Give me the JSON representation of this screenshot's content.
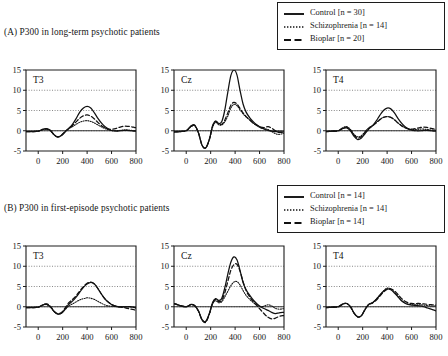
{
  "figure": {
    "sections": [
      {
        "id": "A",
        "title": "(A) P300 in long-term psychotic patients"
      },
      {
        "id": "B",
        "title": "(B) P300 in first-episode psychotic patients"
      }
    ]
  },
  "legends": {
    "A": {
      "entries": [
        {
          "label": "Control [n = 30]",
          "style": "solid",
          "name": "control"
        },
        {
          "label": "Schizophrenia [n = 14]",
          "style": "dotted",
          "name": "schizophrenia"
        },
        {
          "label": "Bioplar [n = 20]",
          "style": "dashed",
          "name": "bipolar"
        }
      ]
    },
    "B": {
      "entries": [
        {
          "label": "Control [n = 14]",
          "style": "solid",
          "name": "control"
        },
        {
          "label": "Schizophrenia [n = 14]",
          "style": "dotted",
          "name": "schizophrenia"
        },
        {
          "label": "Bioplar [n = 14]",
          "style": "dashed",
          "name": "bipolar"
        }
      ]
    }
  },
  "chart_data": [
    {
      "id": "A-T3",
      "type": "line",
      "section": "A",
      "title": "T3",
      "xlabel": "",
      "ylabel": "",
      "xlim": [
        -100,
        800
      ],
      "ylim": [
        -5,
        15
      ],
      "xticks": [
        0,
        200,
        400,
        600,
        800
      ],
      "yticks": [
        -5,
        0,
        5,
        10,
        15
      ],
      "grid": "horizontal-dotted",
      "x": [
        -100,
        -50,
        0,
        40,
        70,
        100,
        130,
        160,
        190,
        220,
        250,
        280,
        310,
        340,
        370,
        400,
        430,
        460,
        490,
        520,
        550,
        580,
        610,
        640,
        670,
        700,
        730,
        760,
        790,
        800
      ],
      "series": [
        {
          "name": "Control",
          "style": "solid",
          "values": [
            -0.2,
            -0.2,
            -0.1,
            0.4,
            0.5,
            0.1,
            -1.0,
            -1.6,
            -1.2,
            -0.3,
            0.6,
            1.6,
            3.0,
            4.6,
            5.6,
            6.0,
            5.6,
            4.4,
            3.0,
            1.8,
            0.9,
            0.3,
            0.0,
            -0.1,
            0.0,
            0.1,
            0.1,
            0.0,
            -0.1,
            -0.1
          ]
        },
        {
          "name": "Schizophrenia",
          "style": "dotted",
          "values": [
            -0.2,
            -0.2,
            -0.1,
            0.3,
            0.4,
            0.0,
            -1.0,
            -1.5,
            -1.1,
            -0.2,
            0.5,
            1.0,
            1.6,
            2.1,
            2.4,
            2.5,
            2.3,
            1.9,
            1.4,
            0.9,
            0.5,
            0.2,
            0.0,
            0.0,
            0.1,
            0.2,
            0.2,
            0.1,
            0.0,
            0.0
          ]
        },
        {
          "name": "Bioplar",
          "style": "dashed",
          "values": [
            -0.2,
            -0.2,
            -0.1,
            0.3,
            0.4,
            0.0,
            -1.0,
            -1.5,
            -1.1,
            -0.2,
            0.6,
            1.3,
            2.2,
            3.1,
            3.7,
            3.9,
            3.6,
            2.9,
            2.0,
            1.2,
            0.7,
            0.4,
            0.4,
            0.6,
            0.9,
            1.1,
            1.1,
            1.0,
            0.8,
            0.8
          ]
        }
      ]
    },
    {
      "id": "A-Cz",
      "type": "line",
      "section": "A",
      "title": "Cz",
      "xlabel": "",
      "ylabel": "",
      "xlim": [
        -100,
        800
      ],
      "ylim": [
        -5,
        15
      ],
      "xticks": [
        0,
        200,
        400,
        600,
        800
      ],
      "yticks": [
        -5,
        0,
        5,
        10,
        15
      ],
      "grid": "horizontal-dotted",
      "x": [
        -100,
        -50,
        0,
        40,
        70,
        100,
        130,
        160,
        190,
        215,
        240,
        265,
        290,
        315,
        340,
        365,
        390,
        415,
        440,
        465,
        490,
        520,
        550,
        580,
        610,
        640,
        670,
        700,
        730,
        760,
        790,
        800
      ],
      "series": [
        {
          "name": "Control",
          "style": "solid",
          "values": [
            -0.3,
            -0.2,
            0.0,
            1.2,
            1.4,
            -0.5,
            -3.6,
            -4.2,
            -2.0,
            1.2,
            2.4,
            1.8,
            2.2,
            5.0,
            9.5,
            13.6,
            15.0,
            13.8,
            10.0,
            6.6,
            4.6,
            3.2,
            2.2,
            1.4,
            0.8,
            0.4,
            0.1,
            -0.1,
            -0.2,
            -0.3,
            -0.3,
            -0.3
          ]
        },
        {
          "name": "Schizophrenia",
          "style": "dotted",
          "values": [
            -0.3,
            -0.2,
            0.0,
            1.0,
            1.2,
            -0.6,
            -3.6,
            -4.2,
            -2.2,
            0.8,
            2.1,
            1.5,
            1.4,
            2.2,
            3.6,
            5.6,
            6.5,
            6.2,
            5.2,
            4.2,
            3.4,
            2.6,
            1.8,
            1.2,
            0.7,
            0.5,
            0.3,
            -0.2,
            -0.7,
            -0.9,
            -0.7,
            -0.6
          ]
        },
        {
          "name": "Bioplar",
          "style": "dashed",
          "values": [
            -0.3,
            -0.2,
            0.0,
            1.1,
            1.3,
            -0.5,
            -3.6,
            -4.2,
            -2.1,
            1.0,
            2.3,
            1.7,
            1.6,
            2.6,
            4.4,
            6.3,
            7.0,
            6.6,
            5.5,
            4.4,
            3.5,
            2.7,
            1.9,
            1.3,
            0.9,
            0.8,
            1.0,
            0.6,
            0.0,
            -0.4,
            -0.4,
            -0.4
          ]
        }
      ]
    },
    {
      "id": "A-T4",
      "type": "line",
      "section": "A",
      "title": "T4",
      "xlabel": "",
      "ylabel": "",
      "xlim": [
        -100,
        800
      ],
      "ylim": [
        -5,
        15
      ],
      "xticks": [
        0,
        200,
        400,
        600,
        800
      ],
      "yticks": [
        -5,
        0,
        5,
        10,
        15
      ],
      "grid": "horizontal-dotted",
      "x": [
        -100,
        -50,
        0,
        40,
        70,
        100,
        130,
        160,
        190,
        220,
        250,
        280,
        310,
        340,
        370,
        400,
        430,
        460,
        490,
        520,
        550,
        580,
        610,
        640,
        670,
        700,
        730,
        760,
        790,
        800
      ],
      "series": [
        {
          "name": "Control",
          "style": "solid",
          "values": [
            -0.2,
            -0.1,
            0.0,
            0.6,
            0.7,
            0.0,
            -1.4,
            -2.2,
            -1.8,
            -0.7,
            0.4,
            1.2,
            2.4,
            3.8,
            5.0,
            5.6,
            5.4,
            4.4,
            3.0,
            1.8,
            0.9,
            0.4,
            0.1,
            0.0,
            0.0,
            0.1,
            0.1,
            0.0,
            -0.1,
            -0.1
          ]
        },
        {
          "name": "Schizophrenia",
          "style": "dotted",
          "values": [
            -0.2,
            -0.1,
            0.0,
            0.8,
            1.0,
            0.3,
            -0.9,
            -1.5,
            -1.2,
            -0.2,
            0.7,
            1.3,
            2.0,
            2.8,
            3.3,
            3.5,
            3.3,
            2.7,
            1.9,
            1.2,
            0.7,
            0.4,
            0.3,
            0.3,
            0.4,
            0.4,
            0.3,
            0.2,
            0.1,
            0.1
          ]
        },
        {
          "name": "Bioplar",
          "style": "dashed",
          "values": [
            -0.2,
            -0.1,
            0.0,
            0.7,
            0.9,
            0.2,
            -1.1,
            -1.8,
            -1.4,
            -0.4,
            0.6,
            1.2,
            1.9,
            2.7,
            3.3,
            3.5,
            3.3,
            2.7,
            1.9,
            1.2,
            0.7,
            0.4,
            0.4,
            0.6,
            0.8,
            0.9,
            0.8,
            0.6,
            0.4,
            0.4
          ]
        }
      ]
    },
    {
      "id": "B-T3",
      "type": "line",
      "section": "B",
      "title": "T3",
      "xlabel": "",
      "ylabel": "",
      "xlim": [
        -100,
        800
      ],
      "ylim": [
        -5,
        15
      ],
      "xticks": [
        0,
        200,
        400,
        600,
        800
      ],
      "yticks": [
        -5,
        0,
        5,
        10,
        15
      ],
      "grid": "horizontal-dotted",
      "x": [
        -100,
        -50,
        0,
        40,
        70,
        100,
        130,
        160,
        190,
        220,
        250,
        280,
        310,
        340,
        370,
        400,
        430,
        460,
        490,
        520,
        550,
        580,
        610,
        640,
        670,
        700,
        730,
        760,
        790,
        800
      ],
      "series": [
        {
          "name": "Control",
          "style": "solid",
          "values": [
            -0.2,
            -0.2,
            -0.1,
            0.5,
            0.6,
            0.0,
            -1.2,
            -1.8,
            -1.6,
            -0.6,
            0.6,
            1.4,
            2.4,
            3.6,
            4.8,
            5.6,
            6.0,
            5.6,
            4.4,
            3.0,
            1.8,
            1.0,
            0.4,
            0.1,
            0.0,
            0.0,
            0.0,
            0.0,
            -0.2,
            -0.3
          ]
        },
        {
          "name": "Schizophrenia",
          "style": "dotted",
          "values": [
            -0.2,
            -0.2,
            -0.1,
            0.4,
            0.5,
            -0.1,
            -1.2,
            -1.8,
            -1.6,
            -0.7,
            0.2,
            0.7,
            1.2,
            1.7,
            2.0,
            2.2,
            2.1,
            1.8,
            1.3,
            0.8,
            0.4,
            0.2,
            0.1,
            0.0,
            0.0,
            0.0,
            0.0,
            -0.1,
            -0.2,
            -0.3
          ]
        },
        {
          "name": "Bioplar",
          "style": "dashed",
          "values": [
            -0.2,
            -0.2,
            -0.1,
            0.5,
            0.7,
            0.1,
            -1.1,
            -1.7,
            -1.4,
            -0.3,
            1.0,
            1.8,
            2.7,
            3.9,
            5.0,
            5.8,
            6.1,
            5.6,
            4.4,
            3.0,
            1.8,
            1.0,
            0.4,
            0.1,
            -0.1,
            -0.2,
            -0.4,
            -0.6,
            -0.8,
            -0.9
          ]
        }
      ]
    },
    {
      "id": "B-Cz",
      "type": "line",
      "section": "B",
      "title": "Cz",
      "xlabel": "",
      "ylabel": "",
      "xlim": [
        -100,
        800
      ],
      "ylim": [
        -5,
        15
      ],
      "xticks": [
        0,
        200,
        400,
        600,
        800
      ],
      "yticks": [
        -5,
        0,
        5,
        10,
        15
      ],
      "grid": "horizontal-dotted",
      "x": [
        -100,
        -50,
        0,
        40,
        70,
        100,
        130,
        160,
        190,
        215,
        240,
        265,
        290,
        315,
        340,
        365,
        390,
        415,
        440,
        465,
        490,
        520,
        550,
        580,
        610,
        640,
        670,
        700,
        730,
        760,
        790,
        800
      ],
      "series": [
        {
          "name": "Control",
          "style": "solid",
          "values": [
            0.8,
            0.3,
            0.0,
            0.6,
            0.3,
            -1.0,
            -3.2,
            -3.6,
            -1.6,
            1.0,
            2.0,
            1.6,
            2.0,
            4.6,
            8.0,
            11.0,
            12.3,
            11.6,
            9.0,
            6.0,
            4.2,
            2.8,
            1.6,
            0.7,
            0.0,
            -0.5,
            -0.9,
            -1.4,
            -1.7,
            -1.5,
            -1.4,
            -1.4
          ]
        },
        {
          "name": "Schizophrenia",
          "style": "dotted",
          "values": [
            0.8,
            0.3,
            0.0,
            0.5,
            0.2,
            -1.1,
            -3.3,
            -3.7,
            -1.8,
            0.6,
            1.5,
            1.0,
            1.2,
            2.4,
            3.8,
            5.2,
            6.1,
            6.2,
            5.4,
            4.0,
            2.8,
            1.8,
            1.0,
            0.4,
            0.0,
            0.2,
            0.5,
            0.2,
            -0.4,
            -0.6,
            -0.5,
            -0.5
          ]
        },
        {
          "name": "Bioplar",
          "style": "dashed",
          "values": [
            0.8,
            0.3,
            0.0,
            0.5,
            0.2,
            -1.1,
            -3.3,
            -3.8,
            -1.7,
            0.8,
            1.8,
            1.3,
            1.5,
            3.4,
            6.2,
            9.0,
            10.4,
            10.5,
            8.8,
            6.2,
            4.0,
            2.4,
            1.2,
            0.2,
            -0.8,
            -1.8,
            -2.6,
            -3.0,
            -2.8,
            -2.4,
            -2.2,
            -2.2
          ]
        }
      ]
    },
    {
      "id": "B-T4",
      "type": "line",
      "section": "B",
      "title": "T4",
      "xlabel": "",
      "ylabel": "",
      "xlim": [
        -100,
        800
      ],
      "ylim": [
        -5,
        15
      ],
      "xticks": [
        0,
        200,
        400,
        600,
        800
      ],
      "yticks": [
        -5,
        0,
        5,
        10,
        15
      ],
      "grid": "horizontal-dotted",
      "x": [
        -100,
        -50,
        0,
        40,
        70,
        100,
        130,
        160,
        190,
        220,
        250,
        280,
        310,
        340,
        370,
        400,
        430,
        460,
        490,
        520,
        550,
        580,
        610,
        640,
        670,
        700,
        730,
        760,
        790,
        800
      ],
      "series": [
        {
          "name": "Control",
          "style": "solid",
          "values": [
            -0.2,
            -0.1,
            0.0,
            0.7,
            0.8,
            0.0,
            -1.6,
            -2.5,
            -2.2,
            -0.7,
            0.6,
            1.0,
            1.8,
            2.8,
            3.8,
            4.4,
            4.2,
            3.4,
            2.4,
            1.4,
            0.8,
            0.5,
            0.4,
            0.3,
            0.2,
            0.0,
            -0.3,
            -0.6,
            -0.9,
            -1.0
          ]
        },
        {
          "name": "Schizophrenia",
          "style": "dotted",
          "values": [
            -0.2,
            -0.1,
            0.0,
            0.7,
            0.8,
            0.0,
            -1.6,
            -2.5,
            -2.2,
            -0.6,
            0.6,
            1.0,
            1.8,
            2.9,
            3.9,
            4.6,
            4.4,
            3.6,
            2.5,
            1.5,
            0.9,
            0.6,
            0.5,
            0.5,
            0.5,
            0.4,
            0.3,
            0.2,
            0.2,
            0.2
          ]
        },
        {
          "name": "Bioplar",
          "style": "dashed",
          "values": [
            -0.2,
            -0.1,
            0.0,
            0.7,
            0.8,
            0.0,
            -1.6,
            -2.5,
            -2.2,
            -0.6,
            0.5,
            0.9,
            1.6,
            2.6,
            3.6,
            4.3,
            4.4,
            3.9,
            3.0,
            2.0,
            1.3,
            0.9,
            0.8,
            0.8,
            0.8,
            0.7,
            0.6,
            0.5,
            0.4,
            0.4
          ]
        }
      ]
    }
  ],
  "colors": {
    "line": "#111111",
    "axis": "#1c1c1c",
    "grid": "#555555",
    "background": "#ffffff"
  }
}
